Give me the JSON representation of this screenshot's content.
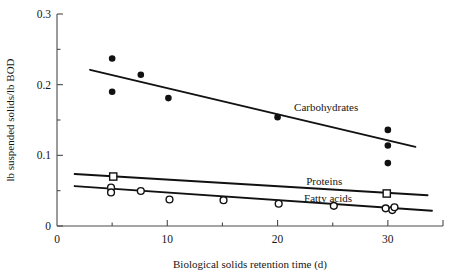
{
  "chart_data": {
    "type": "scatter",
    "title": "",
    "xlabel": "Biological solids retention time (d)",
    "ylabel": "lb suspended solids/lb BOD",
    "xlim": [
      0,
      35
    ],
    "ylim": [
      0,
      0.3
    ],
    "xticks": [
      0,
      10,
      20,
      30
    ],
    "xtick_labels": [
      "0",
      "10",
      "20",
      "30"
    ],
    "xminor_ticks": [
      5,
      15,
      25
    ],
    "yticks": [
      0,
      0.1,
      0.2,
      0.3
    ],
    "ytick_labels": [
      "0",
      "0.1",
      "0.2",
      "0.3"
    ],
    "yminor_ticks": [
      0.05,
      0.15,
      0.25
    ],
    "grid": false,
    "legend_position": "inline-annotations",
    "series": [
      {
        "name": "Carbohydrates",
        "marker": "filled-circle",
        "color": "#111111",
        "label_x": 21.5,
        "label_y": 0.168,
        "points": [
          {
            "x": 5.0,
            "y": 0.237
          },
          {
            "x": 5.0,
            "y": 0.19
          },
          {
            "x": 7.6,
            "y": 0.214
          },
          {
            "x": 10.1,
            "y": 0.181
          },
          {
            "x": 20.0,
            "y": 0.154
          },
          {
            "x": 30.0,
            "y": 0.136
          },
          {
            "x": 30.0,
            "y": 0.114
          },
          {
            "x": 30.0,
            "y": 0.089
          }
        ],
        "fit_line": {
          "x1": 3.0,
          "y1": 0.221,
          "x2": 32.5,
          "y2": 0.112
        }
      },
      {
        "name": "Proteins",
        "marker": "open-square",
        "color": "#111111",
        "label_x": 22.6,
        "label_y": 0.063,
        "points": [
          {
            "x": 5.1,
            "y": 0.07
          },
          {
            "x": 29.9,
            "y": 0.046
          }
        ],
        "fit_line": {
          "x1": 1.6,
          "y1": 0.0735,
          "x2": 33.6,
          "y2": 0.0435
        }
      },
      {
        "name": "Fatty acids",
        "marker": "open-circle",
        "color": "#111111",
        "label_x": 22.4,
        "label_y": 0.0395,
        "points": [
          {
            "x": 4.9,
            "y": 0.0545
          },
          {
            "x": 4.9,
            "y": 0.0475
          },
          {
            "x": 7.6,
            "y": 0.0495
          },
          {
            "x": 10.2,
            "y": 0.0375
          },
          {
            "x": 15.1,
            "y": 0.0365
          },
          {
            "x": 20.1,
            "y": 0.0315
          },
          {
            "x": 25.1,
            "y": 0.0285
          },
          {
            "x": 29.8,
            "y": 0.025
          },
          {
            "x": 30.4,
            "y": 0.0225
          },
          {
            "x": 30.6,
            "y": 0.0265
          }
        ],
        "fit_line": {
          "x1": 1.6,
          "y1": 0.0565,
          "x2": 34.0,
          "y2": 0.0215
        }
      }
    ]
  }
}
